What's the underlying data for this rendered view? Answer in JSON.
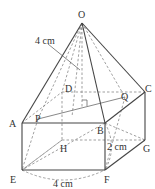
{
  "diagram": {
    "points": {
      "O": {
        "label": "O",
        "x": 82,
        "y": 23
      },
      "A": {
        "label": "A",
        "x": 22,
        "y": 123
      },
      "B": {
        "label": "B",
        "x": 105,
        "y": 123
      },
      "C": {
        "label": "C",
        "x": 145,
        "y": 92
      },
      "D": {
        "label": "D",
        "x": 62,
        "y": 92
      },
      "E": {
        "label": "E",
        "x": 22,
        "y": 170
      },
      "F": {
        "label": "F",
        "x": 105,
        "y": 170
      },
      "G": {
        "label": "G",
        "x": 145,
        "y": 140
      },
      "H": {
        "label": "H",
        "x": 62,
        "y": 140
      },
      "P": {
        "label": "P",
        "x": 38,
        "y": 119
      },
      "Q": {
        "label": "Q",
        "x": 125,
        "y": 97
      }
    },
    "measurements": {
      "slant": "4 cm",
      "height": "2 cm",
      "base": "4 cm"
    },
    "colors": {
      "line": "#444444",
      "dashed": "#777777",
      "text": "#333333"
    }
  }
}
